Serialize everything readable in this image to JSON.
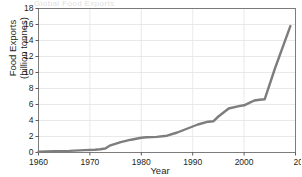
{
  "figure": {
    "title_residue": "Global Food Exports",
    "background_color": "#ffffff"
  },
  "chart_data": {
    "type": "line",
    "title": "",
    "xlabel": "Year",
    "ylabel": "Food Exports (billion tonnes)",
    "ylabel_line1": "Food Exports",
    "ylabel_line2": "(billion tonnes)",
    "xlim": [
      1960,
      2010
    ],
    "ylim": [
      0,
      18
    ],
    "xticks": [
      1960,
      1970,
      1980,
      1990,
      2000,
      2010
    ],
    "xtick_labels": [
      "1960",
      "1970",
      "1980",
      "1990",
      "2000",
      "201"
    ],
    "yticks": [
      0,
      2,
      4,
      6,
      8,
      10,
      12,
      14,
      16,
      18
    ],
    "ytick_labels": [
      "0",
      "2",
      "4",
      "6",
      "8",
      "10",
      "12",
      "14",
      "16",
      "18"
    ],
    "grid": "horizontal-and-vertical",
    "grid_color": "#e3e3e3",
    "legend": "none",
    "line_color": "#7d7d7d",
    "line_width": 2.4,
    "series": [
      {
        "name": "Food Exports",
        "x": [
          1960,
          1963,
          1966,
          1969,
          1971,
          1972,
          1973,
          1974,
          1976,
          1978,
          1980,
          1981,
          1983,
          1985,
          1987,
          1989,
          1991,
          1993,
          1994,
          1995,
          1997,
          1999,
          2000,
          2001,
          2002,
          2003,
          2004,
          2006,
          2009
        ],
        "y": [
          0.1,
          0.15,
          0.2,
          0.3,
          0.35,
          0.4,
          0.5,
          0.9,
          1.3,
          1.6,
          1.85,
          1.9,
          1.95,
          2.1,
          2.5,
          3.0,
          3.5,
          3.85,
          3.9,
          4.5,
          5.5,
          5.8,
          5.9,
          6.2,
          6.5,
          6.6,
          6.65,
          10.5,
          15.8
        ]
      }
    ]
  }
}
